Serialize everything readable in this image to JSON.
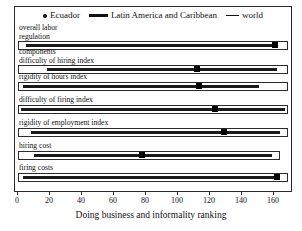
{
  "chart_data": {
    "type": "bar",
    "title": "",
    "xlabel": "Doing business and informality ranking",
    "ylabel": "",
    "xlim": [
      0,
      170
    ],
    "xticks": [
      0,
      20,
      40,
      60,
      80,
      100,
      120,
      140,
      160
    ],
    "xticklabels": [
      "0",
      "20",
      "40",
      "60",
      "80",
      "100",
      "120",
      "140",
      "160"
    ],
    "grid": false,
    "legend_position": "top-center",
    "legend": [
      {
        "name": "Ecuador",
        "marker": "dot"
      },
      {
        "name": "Latin America and Caribbean",
        "marker": "thick-line"
      },
      {
        "name": "world",
        "marker": "thin-line"
      }
    ],
    "categories": [
      "overall labor\nregulation",
      "components\ndifficulty of hiring index",
      "rigidity of hours index",
      "difficulty of firing index",
      "rigidity of employment index",
      "hiring cost",
      "firing costs"
    ],
    "series": [
      {
        "name": "world",
        "type": "range",
        "ranges": [
          [
            0,
            170
          ],
          [
            0,
            170
          ],
          [
            0,
            170
          ],
          [
            0,
            170
          ],
          [
            0,
            170
          ],
          [
            0,
            165
          ],
          [
            0,
            170
          ]
        ]
      },
      {
        "name": "Latin America and Caribbean",
        "type": "range",
        "ranges": [
          [
            5,
            160
          ],
          [
            18,
            163
          ],
          [
            3,
            152
          ],
          [
            2,
            168
          ],
          [
            8,
            165
          ],
          [
            10,
            160
          ],
          [
            3,
            163
          ]
        ]
      },
      {
        "name": "Ecuador",
        "type": "point",
        "values": [
          162,
          113,
          114,
          124,
          130,
          78,
          163
        ]
      }
    ]
  },
  "axis_title": "Doing business and informality ranking"
}
